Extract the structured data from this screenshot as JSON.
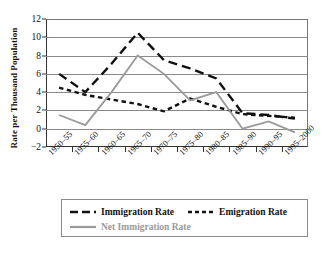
{
  "chart_data": {
    "type": "line",
    "title": "",
    "xlabel": "",
    "ylabel": "Rate per Thousand Population",
    "ylim": [
      -2,
      12
    ],
    "ytick_values": [
      12,
      10,
      8,
      6,
      4,
      2,
      0,
      -2
    ],
    "ytick_labels": [
      "12",
      "10",
      "8",
      "6",
      "4",
      "2",
      "0",
      "−2"
    ],
    "grid": true,
    "legend_position": "below-plot",
    "categories": [
      "1950–55",
      "1955–60",
      "1960–65",
      "1965–70",
      "1970–75",
      "1975–80",
      "1980–85",
      "1985–90",
      "1990–95",
      "1995–2000"
    ],
    "series": [
      {
        "name": "Immigration Rate",
        "style": "long-dash",
        "color": "#111111",
        "values": [
          6.0,
          4.0,
          7.1,
          10.5,
          7.5,
          6.6,
          5.5,
          1.7,
          1.5,
          1.1
        ]
      },
      {
        "name": "Emigration Rate",
        "style": "short-dash",
        "color": "#111111",
        "values": [
          4.5,
          3.7,
          3.2,
          2.7,
          1.9,
          3.3,
          2.4,
          1.6,
          1.4,
          1.2
        ]
      },
      {
        "name": "Net Immigration Rate",
        "style": "solid",
        "color": "#9a9a9a",
        "values": [
          1.5,
          0.4,
          4.0,
          8.0,
          6.0,
          3.1,
          4.0,
          0.0,
          0.8,
          -0.4
        ]
      }
    ]
  },
  "legend": {
    "items": [
      {
        "label": "Immigration Rate",
        "style": "long-dash",
        "color": "#111111"
      },
      {
        "label": "Emigration Rate",
        "style": "short-dash",
        "color": "#111111"
      },
      {
        "label": "Net Immigration Rate",
        "style": "solid",
        "color": "#9a9a9a"
      }
    ]
  },
  "caption": ""
}
